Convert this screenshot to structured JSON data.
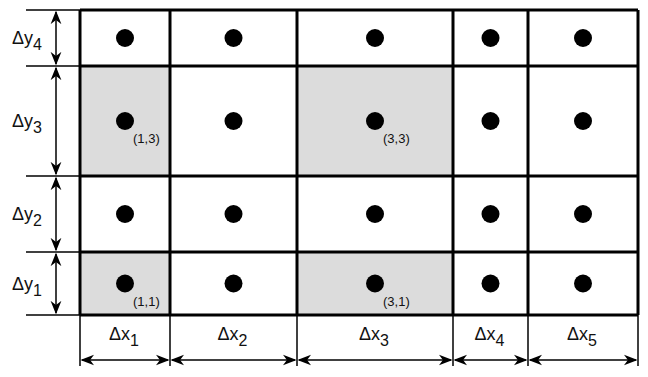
{
  "diagram": {
    "type": "nonuniform-grid",
    "colors": {
      "line": "#000000",
      "shaded": "#dcdcdc",
      "background": "#ffffff",
      "dot": "#000000"
    },
    "grid": {
      "x_edges": [
        80,
        170,
        297,
        453,
        528,
        638
      ],
      "y_edges": [
        10,
        66,
        176,
        252,
        315
      ]
    },
    "shaded_cells": [
      {
        "col": 1,
        "row": 3,
        "label": "(1,3)"
      },
      {
        "col": 3,
        "row": 3,
        "label": "(3,3)"
      },
      {
        "col": 1,
        "row": 1,
        "label": "(1,1)"
      },
      {
        "col": 3,
        "row": 1,
        "label": "(3,1)"
      }
    ],
    "x_dimensions": [
      {
        "symbol": "Δx",
        "sub": "1"
      },
      {
        "symbol": "Δx",
        "sub": "2"
      },
      {
        "symbol": "Δx",
        "sub": "3"
      },
      {
        "symbol": "Δx",
        "sub": "4"
      },
      {
        "symbol": "Δx",
        "sub": "5"
      }
    ],
    "y_dimensions": [
      {
        "symbol": "Δy",
        "sub": "4"
      },
      {
        "symbol": "Δy",
        "sub": "3"
      },
      {
        "symbol": "Δy",
        "sub": "2"
      },
      {
        "symbol": "Δy",
        "sub": "1"
      }
    ]
  }
}
